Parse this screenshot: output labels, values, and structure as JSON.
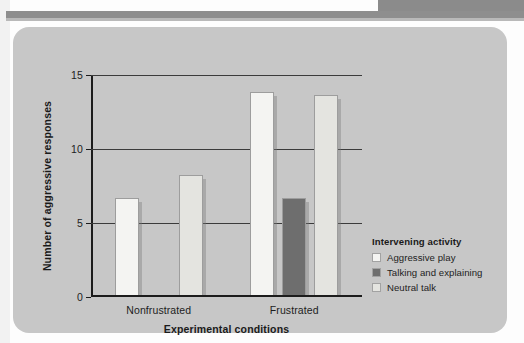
{
  "chart_data": {
    "type": "bar",
    "title": "",
    "xlabel": "Experimental conditions",
    "ylabel": "Number of aggressive responses",
    "categories": [
      "Nonfrustrated",
      "Frustrated"
    ],
    "ylim": [
      0,
      15
    ],
    "yticks": [
      "0",
      "5",
      "10",
      "15"
    ],
    "ytick_values": [
      0,
      5,
      10,
      15
    ],
    "grid": "horizontal",
    "legend_position": "right",
    "legend_title": "Intervening activity",
    "series": [
      {
        "name": "Aggressive play",
        "color": "#f4f4f2",
        "values": [
          6.6,
          13.7
        ]
      },
      {
        "name": "Talking and explaining",
        "color": "#6e6e6e",
        "values": [
          0,
          6.6
        ]
      },
      {
        "name": "Neutral talk",
        "color": "#e4e4e0",
        "values": [
          8.1,
          13.5
        ]
      }
    ]
  },
  "figure": {
    "panel_color": "#c7c7c7",
    "axis_color": "#1c1c1c",
    "gridline_color": "#3b3b3b"
  }
}
